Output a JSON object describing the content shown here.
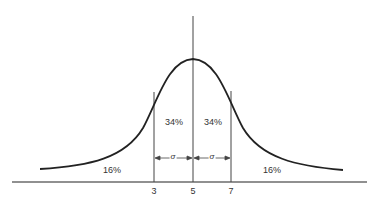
{
  "diagram": {
    "type": "normal-distribution-curve",
    "mean_label": "5",
    "axis_ticks": [
      "3",
      "5",
      "7"
    ],
    "regions": [
      {
        "name": "left-tail",
        "label": "16%"
      },
      {
        "name": "left-center",
        "label": "34%"
      },
      {
        "name": "right-center",
        "label": "34%"
      },
      {
        "name": "right-tail",
        "label": "16%"
      }
    ],
    "sigma_symbol": "σ",
    "line_color": "#222222"
  }
}
